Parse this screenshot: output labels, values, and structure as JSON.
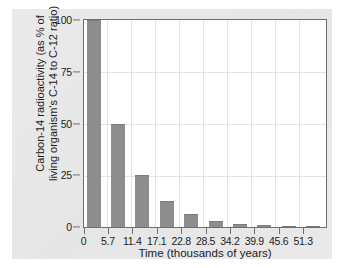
{
  "chart_data": {
    "type": "bar",
    "title": "",
    "xlabel": "Time (thousands of years)",
    "ylabel_line1": "Carbon-14 radioactivity (as % of",
    "ylabel_line2": "living organism's C-14 to C-12 ratio)",
    "categories": [
      "0",
      "5.7",
      "11.4",
      "17.1",
      "22.8",
      "28.5",
      "34.2",
      "39.9",
      "45.6",
      "51.3"
    ],
    "values": [
      100,
      50,
      25,
      12.5,
      6.25,
      3.1,
      1.6,
      0.8,
      0.4,
      0.2
    ],
    "xlim": [
      0,
      51.3
    ],
    "ylim": [
      0,
      100
    ],
    "yticks": [
      0,
      25,
      50,
      75,
      100
    ],
    "ytick_labels": [
      "0",
      "25",
      "50",
      "75",
      "100"
    ],
    "xtick_labels": [
      "0",
      "5.7",
      "11.4",
      "17.1",
      "22.8",
      "28.5",
      "34.2",
      "39.9",
      "45.6",
      "51.3"
    ],
    "grid": true,
    "legend": "none",
    "bar_color": "#8d8d8d",
    "plot_background": "#ffffff",
    "figure_background": "#e8e8e8",
    "axis_color": "#6e6e6e",
    "grid_color": "#e3e3e3",
    "text_color": "#1c1c1c"
  }
}
